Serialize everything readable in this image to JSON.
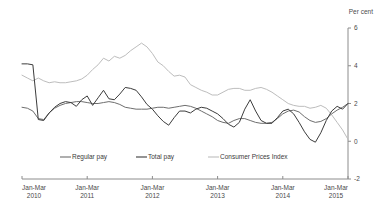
{
  "chart_data": {
    "type": "line",
    "title": "",
    "xlabel": "",
    "ylabel": "Per cent",
    "unit_label": "Per cent",
    "ylim": [
      -2,
      6
    ],
    "yticks": [
      -2,
      0,
      2,
      4,
      6
    ],
    "ytick_labels": [
      "-2",
      "0",
      "2",
      "4",
      "6"
    ],
    "grid": false,
    "legend_position": "bottom-center",
    "x_tick_labels": [
      {
        "line1": "Jan-Mar",
        "line2": "2010"
      },
      {
        "line1": "Jan-Mar",
        "line2": "2011"
      },
      {
        "line1": "Jan-Mar",
        "line2": "2012"
      },
      {
        "line1": "Jan-Mar",
        "line2": "2013"
      },
      {
        "line1": "Jan-Mar",
        "line2": "2014"
      },
      {
        "line1": "Jan-Mar",
        "line2": "2015"
      }
    ],
    "x_start": "Jan-Mar 2010",
    "x_end": "Jan-Mar 2015",
    "n_points": 61,
    "series": [
      {
        "name": "Regular pay",
        "color": "#6e6e6e",
        "values": [
          1.8,
          1.75,
          1.6,
          1.2,
          1.15,
          1.5,
          1.75,
          1.9,
          2.0,
          2.05,
          2.1,
          2.1,
          2.05,
          2.0,
          2.0,
          2.05,
          2.1,
          2.05,
          1.95,
          1.8,
          1.75,
          1.7,
          1.7,
          1.7,
          1.75,
          1.8,
          1.8,
          1.75,
          1.8,
          1.85,
          1.9,
          1.85,
          1.75,
          1.6,
          1.45,
          1.3,
          1.1,
          1.0,
          0.95,
          1.1,
          1.2,
          1.2,
          1.1,
          1.0,
          0.95,
          0.95,
          1.0,
          1.2,
          1.45,
          1.6,
          1.65,
          1.55,
          1.3,
          1.1,
          1.0,
          1.05,
          1.2,
          1.45,
          1.65,
          1.8,
          2.0
        ]
      },
      {
        "name": "Total pay",
        "color": "#3c3c3c",
        "values": [
          4.1,
          4.1,
          4.05,
          1.15,
          1.1,
          1.5,
          1.8,
          2.0,
          2.1,
          2.05,
          1.85,
          2.2,
          2.4,
          1.9,
          2.3,
          2.7,
          2.25,
          2.2,
          2.5,
          2.85,
          2.8,
          2.7,
          2.35,
          1.95,
          1.7,
          1.35,
          1.05,
          0.85,
          1.25,
          1.6,
          1.6,
          1.5,
          1.7,
          1.8,
          1.75,
          1.6,
          1.45,
          1.2,
          0.9,
          0.75,
          1.0,
          1.7,
          2.2,
          1.6,
          1.1,
          0.95,
          0.95,
          1.25,
          1.6,
          1.7,
          1.45,
          1.0,
          0.5,
          0.1,
          -0.05,
          0.45,
          1.1,
          1.6,
          1.85,
          1.7,
          2.0
        ]
      },
      {
        "name": "Consumer Prices Index",
        "color": "#bdbdbd",
        "values": [
          3.5,
          3.35,
          3.2,
          3.35,
          3.2,
          3.1,
          3.15,
          3.1,
          3.1,
          3.15,
          3.2,
          3.3,
          3.5,
          3.8,
          4.05,
          4.4,
          4.25,
          4.5,
          4.4,
          4.55,
          4.8,
          5.0,
          5.2,
          5.0,
          4.65,
          4.2,
          4.0,
          3.7,
          3.45,
          3.5,
          3.4,
          3.0,
          2.85,
          2.7,
          2.6,
          2.45,
          2.45,
          2.6,
          2.75,
          2.8,
          2.8,
          2.7,
          2.7,
          2.8,
          2.85,
          2.75,
          2.6,
          2.4,
          2.2,
          2.0,
          1.9,
          1.85,
          1.85,
          1.75,
          1.8,
          1.9,
          1.75,
          1.4,
          1.0,
          0.6,
          0.1
        ]
      }
    ],
    "legend": [
      {
        "label": "Regular pay",
        "color": "#6e6e6e"
      },
      {
        "label": "Total pay",
        "color": "#3c3c3c"
      },
      {
        "label": "Consumer Prices Index",
        "color": "#bdbdbd"
      }
    ]
  }
}
